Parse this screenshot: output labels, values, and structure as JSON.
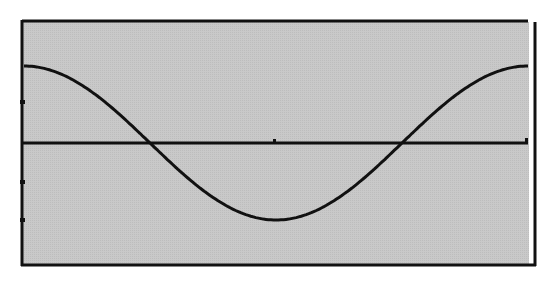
{
  "chart_data": {
    "type": "line",
    "title": "",
    "xlabel": "",
    "ylabel": "",
    "grid": false,
    "legend": null,
    "xlim": [
      0,
      6.2832
    ],
    "ylim": [
      -1.6,
      1.6
    ],
    "series": [
      {
        "name": "cos(x)",
        "x": [
          0,
          0.2618,
          0.5236,
          0.7854,
          1.0472,
          1.309,
          1.5708,
          1.8326,
          2.0944,
          2.3562,
          2.618,
          2.8798,
          3.1416,
          3.4034,
          3.6652,
          3.927,
          4.1888,
          4.4506,
          4.7124,
          4.9742,
          5.236,
          5.4978,
          5.7596,
          6.0214,
          6.2832
        ],
        "values": [
          1.0,
          0.966,
          0.866,
          0.707,
          0.5,
          0.259,
          0.0,
          -0.259,
          -0.5,
          -0.707,
          -0.866,
          -0.966,
          -1.0,
          -0.966,
          -0.866,
          -0.707,
          -0.5,
          -0.259,
          0.0,
          0.259,
          0.5,
          0.707,
          0.866,
          0.966,
          1.0
        ]
      }
    ],
    "reference_lines": [
      {
        "orientation": "horizontal",
        "y": 0
      }
    ],
    "y_ticks_px_hint": [
      102,
      182,
      220
    ],
    "colors": {
      "plot_background": "#c6c6c6",
      "line": "#111111",
      "frame": "#111111",
      "page_background": "#ffffff"
    }
  }
}
